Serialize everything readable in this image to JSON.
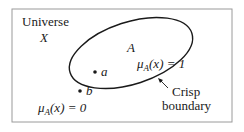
{
  "universe": {
    "label": "Universe",
    "symbol": "X"
  },
  "set": {
    "symbol": "A",
    "inside_membership": "μ_A(x) = 1"
  },
  "points": [
    {
      "label": "a",
      "location": "inside"
    },
    {
      "label": "b",
      "location": "outside"
    }
  ],
  "outside_membership": "μ_A(x) = 0",
  "boundary_annotation": {
    "line1": "Crisp",
    "line2": "boundary"
  }
}
